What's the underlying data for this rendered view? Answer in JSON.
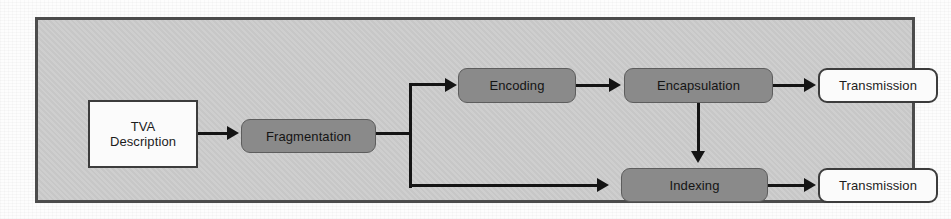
{
  "diagram": {
    "colors": {
      "container_fill": "#c9c9c9",
      "container_border": "#4c4c4c",
      "process_fill": "#8a8a8a",
      "process_border": "#5d5d5d",
      "terminal_fill": "#fbfbfb",
      "terminal_border": "#3c3c3c",
      "connector": "#141414",
      "page_background": "#fdfdfd"
    },
    "nodes": [
      {
        "id": "tva-description",
        "label": "TVA\nDescription",
        "line1": "TVA",
        "line2": "Description",
        "shape": "rectangle",
        "style": "terminal"
      },
      {
        "id": "fragmentation",
        "label": "Fragmentation",
        "shape": "rounded-rectangle",
        "style": "process"
      },
      {
        "id": "encoding",
        "label": "Encoding",
        "shape": "rounded-rectangle",
        "style": "process"
      },
      {
        "id": "encapsulation",
        "label": "Encapsulation",
        "shape": "rounded-rectangle",
        "style": "process"
      },
      {
        "id": "transmission-top",
        "label": "Transmission",
        "shape": "rounded-rectangle",
        "style": "terminal"
      },
      {
        "id": "indexing",
        "label": "Indexing",
        "shape": "rounded-rectangle",
        "style": "process"
      },
      {
        "id": "transmission-bottom",
        "label": "Transmission",
        "shape": "rounded-rectangle",
        "style": "terminal"
      }
    ],
    "edges": [
      {
        "from": "tva-description",
        "to": "fragmentation",
        "type": "arrow-right"
      },
      {
        "from": "fragmentation",
        "to": "encoding",
        "type": "branch-up-arrow-right"
      },
      {
        "from": "fragmentation",
        "to": "indexing",
        "type": "branch-down-arrow-right"
      },
      {
        "from": "encoding",
        "to": "encapsulation",
        "type": "arrow-right"
      },
      {
        "from": "encapsulation",
        "to": "transmission-top",
        "type": "arrow-right"
      },
      {
        "from": "encapsulation",
        "to": "indexing",
        "type": "arrow-down"
      },
      {
        "from": "indexing",
        "to": "transmission-bottom",
        "type": "arrow-right"
      }
    ]
  }
}
